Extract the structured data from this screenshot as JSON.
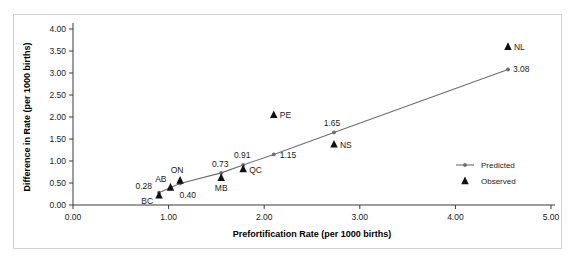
{
  "chart_data": {
    "type": "scatter",
    "title": "",
    "xlabel": "Prefortification Rate (per 1000 births)",
    "ylabel": "Difference in Rate (per 1000 births)",
    "xlim": [
      0.0,
      5.0
    ],
    "ylim": [
      0.0,
      4.0
    ],
    "xticks": [
      "0.00",
      "1.00",
      "2.00",
      "3.00",
      "4.00",
      "5.00"
    ],
    "yticks": [
      "0.00",
      "0.50",
      "1.00",
      "1.50",
      "2.00",
      "2.50",
      "3.00",
      "3.50",
      "4.00"
    ],
    "grid": false,
    "legend_position": "right",
    "series": [
      {
        "name": "Predicted",
        "marker": "line-with-dot",
        "color": "#6e6e6e",
        "points": [
          {
            "x": 0.9,
            "y": 0.28,
            "label": "0.28"
          },
          {
            "x": 1.02,
            "y": 0.4,
            "label": "0.40"
          },
          {
            "x": 1.12,
            "y": 0.49,
            "label": ""
          },
          {
            "x": 1.55,
            "y": 0.73,
            "label": "0.73"
          },
          {
            "x": 1.78,
            "y": 0.91,
            "label": "0.91"
          },
          {
            "x": 2.1,
            "y": 1.15,
            "label": "1.15"
          },
          {
            "x": 2.73,
            "y": 1.65,
            "label": "1.65"
          },
          {
            "x": 4.55,
            "y": 3.08,
            "label": "3.08"
          }
        ]
      },
      {
        "name": "Observed",
        "marker": "triangle",
        "color": "#111111",
        "points": [
          {
            "x": 0.9,
            "y": 0.22,
            "label": "BC"
          },
          {
            "x": 1.02,
            "y": 0.4,
            "label": "AB"
          },
          {
            "x": 1.12,
            "y": 0.56,
            "label": "ON"
          },
          {
            "x": 1.55,
            "y": 0.62,
            "label": "MB"
          },
          {
            "x": 1.78,
            "y": 0.82,
            "label": "QC"
          },
          {
            "x": 2.1,
            "y": 2.05,
            "label": "PE"
          },
          {
            "x": 2.73,
            "y": 1.38,
            "label": "NS"
          },
          {
            "x": 4.55,
            "y": 3.6,
            "label": "NL"
          }
        ]
      }
    ],
    "legend": [
      {
        "label": "Predicted",
        "marker": "line-with-dot"
      },
      {
        "label": "Observed",
        "marker": "triangle"
      }
    ]
  }
}
